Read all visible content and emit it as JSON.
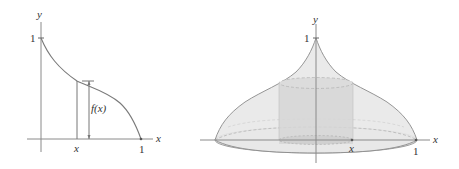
{
  "figure_left": {
    "y_axis_label": "y",
    "x_axis_label": "x",
    "y_tick_label": "1",
    "x_tick_label": "1",
    "x_marker_label": "x",
    "height_label": "f(x)"
  },
  "figure_right": {
    "y_axis_label": "y",
    "x_axis_label": "x",
    "y_tick_label": "1",
    "x_tick_label": "1",
    "x_marker_label": "x"
  },
  "colors": {
    "axis": "#8a8a8a",
    "curve": "#7a7a7a",
    "dome_fill": "#e8e8e8",
    "cylinder_fill": "#d6d6d6",
    "dashed": "#b5b5b5",
    "text": "#333333"
  }
}
